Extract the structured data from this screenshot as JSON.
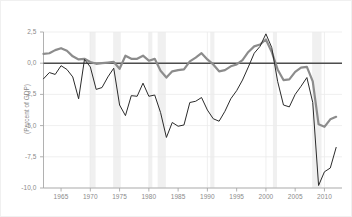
{
  "chart_data": {
    "type": "line",
    "title": "",
    "subtitle": "",
    "xlabel": "",
    "ylabel": "(Percent of GDP)",
    "xlim": [
      1962,
      2013
    ],
    "ylim": [
      -10.0,
      2.5
    ],
    "grid": true,
    "legend_position": "none",
    "xticks": [
      1965,
      1970,
      1975,
      1980,
      1985,
      1990,
      1995,
      2000,
      2005,
      2010
    ],
    "xtick_labels": [
      "1965",
      "1970",
      "1975",
      "1980",
      "1985",
      "1990",
      "1995",
      "2000",
      "2005",
      "2010"
    ],
    "yticks": [
      2.5,
      0.0,
      -2.5,
      -5.0,
      -7.5,
      -10.0
    ],
    "ytick_labels": [
      "2,5",
      "0,0",
      "-2,5",
      "-5,0",
      "-7,5",
      "-10,0"
    ],
    "reference_line": {
      "value": 0.0,
      "color": "#4d4d4d",
      "width": 1.6
    },
    "colors": {
      "series_thick": "#8c8c8c",
      "series_thin": "#2b2b2b",
      "recession_band": "#f0f0f0",
      "gridline": "#ebebeb",
      "axis": "#a8a8a8",
      "tick_text": "#8a8a8a",
      "background": "#ffffff"
    },
    "recession_bands": [
      {
        "start": 1969.9,
        "end": 1970.9
      },
      {
        "start": 1973.9,
        "end": 1975.2
      },
      {
        "start": 1980.0,
        "end": 1980.6
      },
      {
        "start": 1981.5,
        "end": 1982.9
      },
      {
        "start": 1990.5,
        "end": 1991.2
      },
      {
        "start": 2001.2,
        "end": 2001.9
      },
      {
        "start": 2007.9,
        "end": 2009.5
      }
    ],
    "series": [
      {
        "name": "Primary balance",
        "style": "thick-gray",
        "color": "#8c8c8c",
        "width": 2.2,
        "x": [
          1962,
          1963,
          1964,
          1965,
          1966,
          1967,
          1968,
          1969,
          1970,
          1971,
          1972,
          1973,
          1974,
          1975,
          1976,
          1977,
          1978,
          1979,
          1980,
          1981,
          1982,
          1983,
          1984,
          1985,
          1986,
          1987,
          1988,
          1989,
          1990,
          1991,
          1992,
          1993,
          1994,
          1995,
          1996,
          1997,
          1998,
          1999,
          2000,
          2001,
          2002,
          2003,
          2004,
          2005,
          2006,
          2007,
          2008,
          2009,
          2010,
          2011,
          2012
        ],
        "values": [
          0.75,
          0.8,
          1.05,
          1.2,
          1.0,
          0.55,
          0.3,
          0.35,
          0.1,
          -0.05,
          0.0,
          0.05,
          0.1,
          -0.45,
          0.6,
          0.35,
          0.35,
          0.6,
          0.2,
          0.35,
          -0.6,
          -1.15,
          -0.65,
          -0.55,
          -0.5,
          0.15,
          0.45,
          0.8,
          0.3,
          -0.1,
          -0.65,
          -0.55,
          -0.25,
          -0.1,
          0.25,
          0.9,
          1.35,
          1.5,
          1.9,
          0.9,
          -0.5,
          -1.35,
          -1.3,
          -0.7,
          -0.35,
          -0.3,
          -1.45,
          -4.9,
          -5.1,
          -4.5,
          -4.3
        ]
      },
      {
        "name": "Overall budget balance",
        "style": "thin-dark",
        "color": "#2b2b2b",
        "width": 1.0,
        "x": [
          1962,
          1963,
          1964,
          1965,
          1966,
          1967,
          1968,
          1969,
          1970,
          1971,
          1972,
          1973,
          1974,
          1975,
          1976,
          1977,
          1978,
          1979,
          1980,
          1981,
          1982,
          1983,
          1984,
          1985,
          1986,
          1987,
          1988,
          1989,
          1990,
          1991,
          1992,
          1993,
          1994,
          1995,
          1996,
          1997,
          1998,
          1999,
          2000,
          2001,
          2002,
          2003,
          2004,
          2005,
          2006,
          2007,
          2008,
          2009,
          2010,
          2011,
          2012
        ],
        "values": [
          -1.25,
          -0.75,
          -0.9,
          -0.2,
          -0.5,
          -1.1,
          -2.85,
          0.3,
          -0.3,
          -2.1,
          -1.95,
          -1.1,
          -0.4,
          -3.35,
          -4.2,
          -2.6,
          -2.65,
          -1.6,
          -2.65,
          -2.55,
          -3.95,
          -5.95,
          -4.75,
          -5.05,
          -4.95,
          -3.15,
          -3.05,
          -2.75,
          -3.75,
          -4.45,
          -4.65,
          -3.85,
          -2.85,
          -2.2,
          -1.35,
          -0.3,
          0.8,
          1.35,
          2.35,
          1.25,
          -1.45,
          -3.35,
          -3.5,
          -2.5,
          -1.85,
          -1.15,
          -3.15,
          -9.8,
          -8.7,
          -8.4,
          -6.75
        ]
      }
    ]
  }
}
